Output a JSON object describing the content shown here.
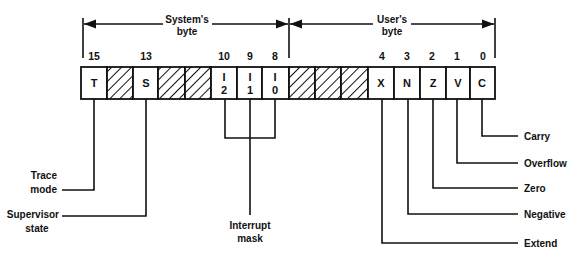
{
  "diagram": {
    "groups": {
      "system": {
        "label_line1": "System's",
        "label_line2": "byte"
      },
      "user": {
        "label_line1": "User's",
        "label_line2": "byte"
      }
    },
    "bit_numbers": [
      {
        "bit": "15",
        "x": 93
      },
      {
        "bit": "13",
        "x": 146
      },
      {
        "bit": "10",
        "x": 225
      },
      {
        "bit": "9",
        "x": 250
      },
      {
        "bit": "8",
        "x": 275
      },
      {
        "bit": "4",
        "x": 383
      },
      {
        "bit": "3",
        "x": 407
      },
      {
        "bit": "2",
        "x": 432
      },
      {
        "bit": "1",
        "x": 457
      },
      {
        "bit": "0",
        "x": 483
      }
    ],
    "cells": [
      {
        "bit": 15,
        "text": "T",
        "hatched": false
      },
      {
        "bit": 14,
        "text": "",
        "hatched": true
      },
      {
        "bit": 13,
        "text": "S",
        "hatched": false
      },
      {
        "bit": 12,
        "text": "",
        "hatched": true
      },
      {
        "bit": 11,
        "text": "",
        "hatched": true
      },
      {
        "bit": 10,
        "text_top": "I",
        "text_bottom": "2",
        "hatched": false
      },
      {
        "bit": 9,
        "text_top": "I",
        "text_bottom": "1",
        "hatched": false
      },
      {
        "bit": 8,
        "text_top": "I",
        "text_bottom": "0",
        "hatched": false
      },
      {
        "bit": 7,
        "text": "",
        "hatched": true
      },
      {
        "bit": 6,
        "text": "",
        "hatched": true
      },
      {
        "bit": 5,
        "text": "",
        "hatched": true
      },
      {
        "bit": 4,
        "text": "X",
        "hatched": false
      },
      {
        "bit": 3,
        "text": "N",
        "hatched": false
      },
      {
        "bit": 2,
        "text": "Z",
        "hatched": false
      },
      {
        "bit": 1,
        "text": "V",
        "hatched": false
      },
      {
        "bit": 0,
        "text": "C",
        "hatched": false
      }
    ],
    "callouts": {
      "trace": {
        "line1": "Trace",
        "line2": "mode"
      },
      "supervisor": {
        "line1": "Supervisor",
        "line2": "state"
      },
      "interrupt": {
        "line1": "Interrupt",
        "line2": "mask"
      },
      "carry": "Carry",
      "overflow": "Overflow",
      "zero": "Zero",
      "negative": "Negative",
      "extend": "Extend"
    },
    "colors": {
      "ink": "#111111",
      "background": "#ffffff"
    }
  }
}
